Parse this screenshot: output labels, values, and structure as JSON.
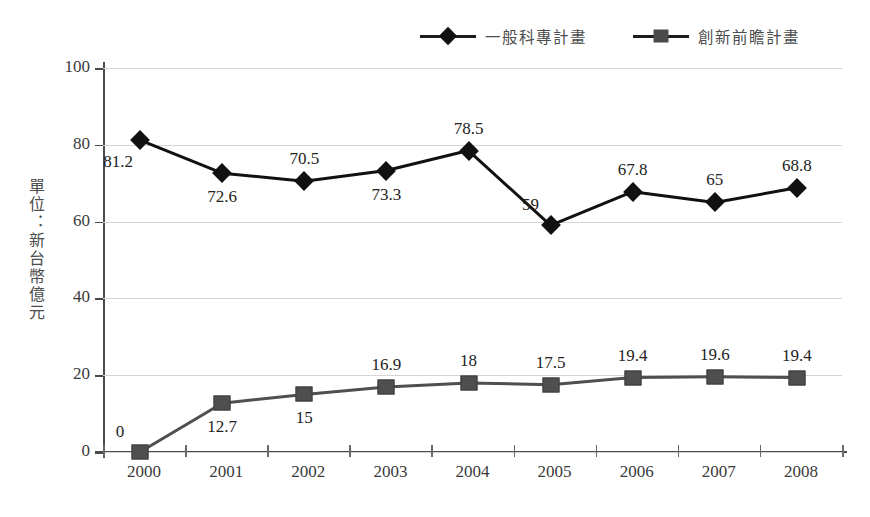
{
  "chart_data": {
    "type": "line",
    "title": "",
    "xlabel": "",
    "ylabel": "單位：新台幣億元",
    "categories": [
      "2000",
      "2001",
      "2002",
      "2003",
      "2004",
      "2005",
      "2006",
      "2007",
      "2008"
    ],
    "ylim": [
      0,
      100
    ],
    "yticks": [
      0,
      20,
      40,
      60,
      80,
      100
    ],
    "grid": true,
    "legend_position": "top-right",
    "series": [
      {
        "name": "一般科專計畫",
        "marker": "diamond",
        "color": "#111111",
        "values": [
          81.2,
          72.6,
          70.5,
          73.3,
          78.5,
          59,
          67.8,
          65,
          68.8
        ],
        "labels": [
          "81.2",
          "72.6",
          "70.5",
          "73.3",
          "78.5",
          "59",
          "67.8",
          "65",
          "68.8"
        ],
        "label_pos": [
          "below-left",
          "below",
          "above",
          "below",
          "above",
          "above-left",
          "above",
          "above",
          "above"
        ]
      },
      {
        "name": "創新前瞻計畫",
        "marker": "square",
        "color": "#4f4f4f",
        "values": [
          0,
          12.7,
          15,
          16.9,
          18,
          17.5,
          19.4,
          19.6,
          19.4
        ],
        "labels": [
          "0",
          "12.7",
          "15",
          "16.9",
          "18",
          "17.5",
          "19.4",
          "19.6",
          "19.4"
        ],
        "label_pos": [
          "above-left",
          "below",
          "below",
          "above",
          "above",
          "above",
          "above",
          "above",
          "above"
        ]
      }
    ]
  },
  "legend": {
    "items": [
      {
        "label": "一般科專計畫",
        "marker": "diamond-marker"
      },
      {
        "label": "創新前瞻計畫",
        "marker": "square-marker"
      }
    ]
  },
  "axis": {
    "y_title": "單位：新台幣億元",
    "y_tick_labels": [
      "100",
      "80",
      "60",
      "40",
      "20",
      "0"
    ],
    "x_tick_labels": [
      "2000",
      "2001",
      "2002",
      "2003",
      "2004",
      "2005",
      "2006",
      "2007",
      "2008"
    ]
  }
}
